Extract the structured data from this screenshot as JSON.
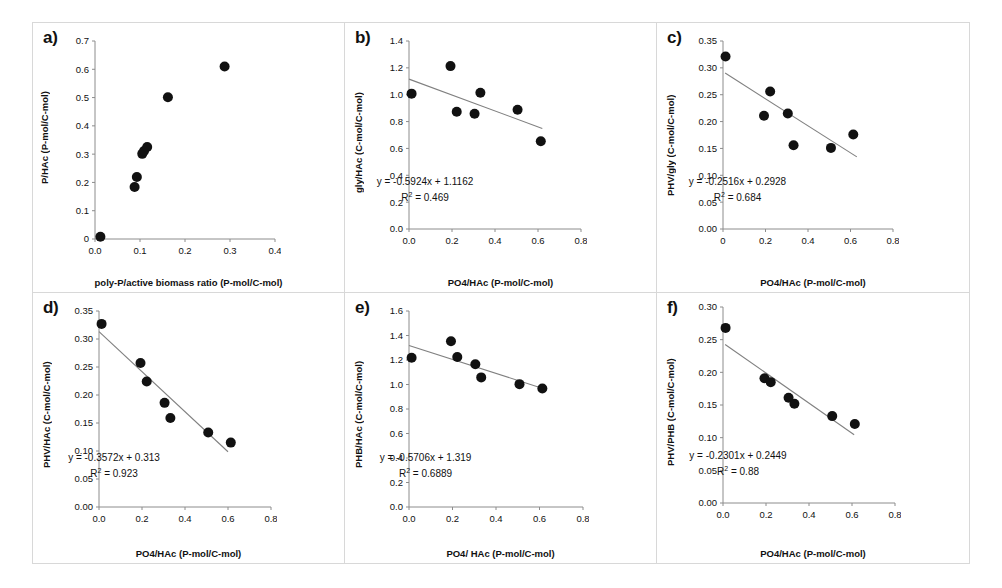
{
  "figure": {
    "panel_count": 6,
    "point_color": "#111111",
    "line_color": "#808080",
    "axis_color": "#8c8c8c",
    "border_color": "#d8d8d8"
  },
  "panels": [
    {
      "letter": "a)",
      "ylabel": "P/HAc (P-mol/C-mol)",
      "xlabel": "poly-P/active biomass ratio (P-mol/C-mol)",
      "equation": "",
      "r2": "",
      "chart_data": {
        "type": "scatter",
        "title": "a)",
        "xlabel": "poly-P/active biomass ratio (P-mol/C-mol)",
        "ylabel": "P/HAc (P-mol/C-mol)",
        "xlim": [
          0.0,
          0.4
        ],
        "ylim": [
          0.0,
          0.7
        ],
        "xticks": [
          "0.0",
          "0.1",
          "0.2",
          "0.3",
          "0.4"
        ],
        "yticks": [
          "0",
          "0.1",
          "0.2",
          "0.3",
          "0.4",
          "0.5",
          "0.6",
          "0.7"
        ],
        "grid": false,
        "legend": "none",
        "trendline": null,
        "points": [
          {
            "x": 0.012,
            "y": 0.008
          },
          {
            "x": 0.088,
            "y": 0.184
          },
          {
            "x": 0.093,
            "y": 0.219
          },
          {
            "x": 0.105,
            "y": 0.301
          },
          {
            "x": 0.109,
            "y": 0.311
          },
          {
            "x": 0.116,
            "y": 0.325
          },
          {
            "x": 0.162,
            "y": 0.501
          },
          {
            "x": 0.288,
            "y": 0.61
          }
        ]
      }
    },
    {
      "letter": "b)",
      "ylabel": "gly/HAc (C-mol/C-mol)",
      "xlabel": "PO4/HAc (P-mol/C-mol)",
      "equation": "y = -0.5924x + 1.1162",
      "r2": "R² = 0.469",
      "chart_data": {
        "type": "scatter",
        "title": "b)",
        "xlabel": "PO4/HAc (P-mol/C-mol)",
        "ylabel": "gly/HAc (C-mol/C-mol)",
        "xlim": [
          0.0,
          0.8
        ],
        "ylim": [
          0.0,
          1.4
        ],
        "xticks": [
          "0.0",
          "0.2",
          "0.4",
          "0.6",
          "0.8"
        ],
        "yticks": [
          "0.0",
          "0.2",
          "0.4",
          "0.6",
          "0.8",
          "1.0",
          "1.2",
          "1.4"
        ],
        "grid": false,
        "legend": "none",
        "trendline": {
          "slope": -0.5924,
          "intercept": 1.1162,
          "r2": 0.469,
          "x_start": 0.0,
          "x_end": 0.62
        },
        "points": [
          {
            "x": 0.012,
            "y": 1.008
          },
          {
            "x": 0.193,
            "y": 1.213
          },
          {
            "x": 0.222,
            "y": 0.873
          },
          {
            "x": 0.305,
            "y": 0.858
          },
          {
            "x": 0.332,
            "y": 1.015
          },
          {
            "x": 0.505,
            "y": 0.888
          },
          {
            "x": 0.613,
            "y": 0.653
          }
        ]
      }
    },
    {
      "letter": "c)",
      "ylabel": "PHV/gly (C-mol/C-mol)",
      "xlabel": "PO4/HAc (P-mol/C-mol)",
      "equation": "y = -0.2516x + 0.2928",
      "r2": "R² = 0.684",
      "chart_data": {
        "type": "scatter",
        "title": "c)",
        "xlabel": "PO4/HAc (P-mol/C-mol)",
        "ylabel": "PHV/gly (C-mol/C-mol)",
        "xlim": [
          0.0,
          0.8
        ],
        "ylim": [
          0.0,
          0.35
        ],
        "xticks": [
          "0",
          "0.2",
          "0.4",
          "0.6",
          "0.8"
        ],
        "yticks": [
          "0.00",
          "0.05",
          "0.10",
          "0.15",
          "0.20",
          "0.25",
          "0.30",
          "0.35"
        ],
        "grid": false,
        "legend": "none",
        "trendline": {
          "slope": -0.2516,
          "intercept": 0.2928,
          "r2": 0.684,
          "x_start": 0.01,
          "x_end": 0.63
        },
        "points": [
          {
            "x": 0.012,
            "y": 0.321
          },
          {
            "x": 0.193,
            "y": 0.211
          },
          {
            "x": 0.222,
            "y": 0.256
          },
          {
            "x": 0.305,
            "y": 0.215
          },
          {
            "x": 0.332,
            "y": 0.156
          },
          {
            "x": 0.508,
            "y": 0.151
          },
          {
            "x": 0.613,
            "y": 0.176
          }
        ]
      }
    },
    {
      "letter": "d)",
      "ylabel": "PHV/HAc (C-mol/C-mol)",
      "xlabel": "PO4/HAc (P-mol/C-mol)",
      "equation": "y = -0.3572x + 0.313",
      "r2": "R² = 0.923",
      "chart_data": {
        "type": "scatter",
        "title": "d)",
        "xlabel": "PO4/HAc (P-mol/C-mol)",
        "ylabel": "PHV/HAc (C-mol/C-mol)",
        "xlim": [
          0.0,
          0.8
        ],
        "ylim": [
          0.0,
          0.35
        ],
        "xticks": [
          "0.0",
          "0.2",
          "0.4",
          "0.6",
          "0.8"
        ],
        "yticks": [
          "0.00",
          "0.05",
          "0.10",
          "0.15",
          "0.20",
          "0.25",
          "0.30",
          "0.35"
        ],
        "grid": false,
        "legend": "none",
        "trendline": {
          "slope": -0.3572,
          "intercept": 0.313,
          "r2": 0.923,
          "x_start": 0.0,
          "x_end": 0.6
        },
        "points": [
          {
            "x": 0.012,
            "y": 0.327
          },
          {
            "x": 0.193,
            "y": 0.257
          },
          {
            "x": 0.222,
            "y": 0.224
          },
          {
            "x": 0.305,
            "y": 0.186
          },
          {
            "x": 0.332,
            "y": 0.159
          },
          {
            "x": 0.508,
            "y": 0.133
          },
          {
            "x": 0.613,
            "y": 0.115
          }
        ]
      }
    },
    {
      "letter": "e)",
      "ylabel": "PHB/HAc (C-mol/C-mol)",
      "xlabel": "PO4/ HAc (P-mol/C-mol)",
      "equation": "y = -0.5706x + 1.319",
      "r2": "R² = 0.6889",
      "chart_data": {
        "type": "scatter",
        "title": "e)",
        "xlabel": "PO4/ HAc (P-mol/C-mol)",
        "ylabel": "PHB/HAc (C-mol/C-mol)",
        "xlim": [
          0.0,
          0.8
        ],
        "ylim": [
          0.0,
          1.6
        ],
        "xticks": [
          "0.0",
          "0.2",
          "0.4",
          "0.6",
          "0.8"
        ],
        "yticks": [
          "0.0",
          "0.2",
          "0.4",
          "0.6",
          "0.8",
          "1.0",
          "1.2",
          "1.4",
          "1.6"
        ],
        "grid": false,
        "legend": "none",
        "trendline": {
          "slope": -0.5706,
          "intercept": 1.319,
          "r2": 0.6889,
          "x_start": 0.0,
          "x_end": 0.63
        },
        "points": [
          {
            "x": 0.012,
            "y": 1.218
          },
          {
            "x": 0.193,
            "y": 1.353
          },
          {
            "x": 0.222,
            "y": 1.224
          },
          {
            "x": 0.305,
            "y": 1.166
          },
          {
            "x": 0.332,
            "y": 1.058
          },
          {
            "x": 0.508,
            "y": 1.003
          },
          {
            "x": 0.613,
            "y": 0.968
          }
        ]
      }
    },
    {
      "letter": "f)",
      "ylabel": "PHV/PHB (C-mol/C-mol)",
      "xlabel": "PO4/HAc (P-mol/C-mol)",
      "equation": "y = -0.2301x + 0.2449",
      "r2": "R² = 0.88",
      "chart_data": {
        "type": "scatter",
        "title": "f)",
        "xlabel": "PO4/HAc (P-mol/C-mol)",
        "ylabel": "PHV/PHB (C-mol/C-mol)",
        "xlim": [
          0.0,
          0.8
        ],
        "ylim": [
          0.0,
          0.3
        ],
        "xticks": [
          "0.0",
          "0.2",
          "0.4",
          "0.6",
          "0.8"
        ],
        "yticks": [
          "0.00",
          "0.05",
          "0.10",
          "0.15",
          "0.20",
          "0.25",
          "0.30"
        ],
        "grid": false,
        "legend": "none",
        "trendline": {
          "slope": -0.2301,
          "intercept": 0.2449,
          "r2": 0.88,
          "x_start": 0.01,
          "x_end": 0.61
        },
        "points": [
          {
            "x": 0.012,
            "y": 0.268
          },
          {
            "x": 0.193,
            "y": 0.191
          },
          {
            "x": 0.222,
            "y": 0.185
          },
          {
            "x": 0.305,
            "y": 0.161
          },
          {
            "x": 0.332,
            "y": 0.152
          },
          {
            "x": 0.508,
            "y": 0.133
          },
          {
            "x": 0.613,
            "y": 0.121
          }
        ]
      }
    }
  ]
}
